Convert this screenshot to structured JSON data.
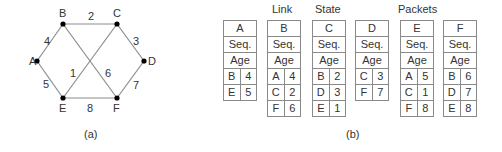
{
  "graph": {
    "nodes": [
      {
        "id": "A",
        "x": 37,
        "y": 61,
        "lx": 29,
        "ly": 65
      },
      {
        "id": "B",
        "x": 63,
        "y": 24,
        "lx": 59,
        "ly": 17
      },
      {
        "id": "C",
        "x": 117,
        "y": 24,
        "lx": 113,
        "ly": 17
      },
      {
        "id": "D",
        "x": 144,
        "y": 61,
        "lx": 148,
        "ly": 65
      },
      {
        "id": "E",
        "x": 63,
        "y": 98,
        "lx": 59,
        "ly": 112
      },
      {
        "id": "F",
        "x": 117,
        "y": 98,
        "lx": 113,
        "ly": 112
      }
    ],
    "edges": [
      {
        "from": "A",
        "to": "B",
        "weight": "4",
        "lx": 44,
        "ly": 45
      },
      {
        "from": "B",
        "to": "C",
        "weight": "2",
        "lx": 88,
        "ly": 20
      },
      {
        "from": "C",
        "to": "D",
        "weight": "3",
        "lx": 133,
        "ly": 45
      },
      {
        "from": "A",
        "to": "E",
        "weight": "5",
        "lx": 43,
        "ly": 88
      },
      {
        "from": "E",
        "to": "F",
        "weight": "8",
        "lx": 87,
        "ly": 112
      },
      {
        "from": "D",
        "to": "F",
        "weight": "7",
        "lx": 133,
        "ly": 89
      },
      {
        "from": "E",
        "to": "C",
        "weight": "1",
        "lx": 70,
        "ly": 77
      },
      {
        "from": "B",
        "to": "F",
        "weight": "6",
        "lx": 105,
        "ly": 77
      }
    ],
    "caption": "(a)"
  },
  "headers": {
    "link": "Link",
    "state": "State",
    "packets": "Packets"
  },
  "packets": [
    {
      "router": "A",
      "seq": "Seq.",
      "age": "Age",
      "entries": [
        [
          "B",
          "4"
        ],
        [
          "E",
          "5"
        ]
      ]
    },
    {
      "router": "B",
      "seq": "Seq.",
      "age": "Age",
      "entries": [
        [
          "A",
          "4"
        ],
        [
          "C",
          "2"
        ],
        [
          "F",
          "6"
        ]
      ]
    },
    {
      "router": "C",
      "seq": "Seq.",
      "age": "Age",
      "entries": [
        [
          "B",
          "2"
        ],
        [
          "D",
          "3"
        ],
        [
          "E",
          "1"
        ]
      ]
    },
    {
      "router": "D",
      "seq": "Seq.",
      "age": "Age",
      "entries": [
        [
          "C",
          "3"
        ],
        [
          "F",
          "7"
        ]
      ]
    },
    {
      "router": "E",
      "seq": "Seq.",
      "age": "Age",
      "entries": [
        [
          "A",
          "5"
        ],
        [
          "C",
          "1"
        ],
        [
          "F",
          "8"
        ]
      ]
    },
    {
      "router": "F",
      "seq": "Seq.",
      "age": "Age",
      "entries": [
        [
          "B",
          "6"
        ],
        [
          "D",
          "7"
        ],
        [
          "E",
          "8"
        ]
      ]
    }
  ],
  "caption_b": "(b)"
}
